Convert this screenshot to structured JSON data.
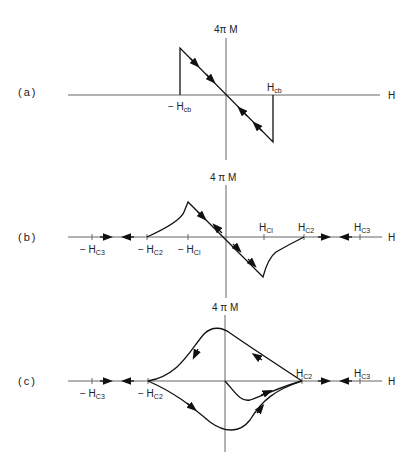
{
  "panels": [
    {
      "id": "a",
      "label": "(a)",
      "y_axis_label": "4π M",
      "x_axis_label": "H",
      "ticks": [
        {
          "text": "− H",
          "sub": "cb"
        },
        {
          "text": "H",
          "sub": "cb"
        }
      ]
    },
    {
      "id": "b",
      "label": "(b)",
      "y_axis_label": "4 π M",
      "x_axis_label": "H",
      "ticks": [
        {
          "text": "− H",
          "sub": "C3"
        },
        {
          "text": "− H",
          "sub": "C2"
        },
        {
          "text": "− H",
          "sub": "Cl"
        },
        {
          "text": "H",
          "sub": "Cl"
        },
        {
          "text": "H",
          "sub": "C2"
        },
        {
          "text": "H",
          "sub": "C3"
        }
      ]
    },
    {
      "id": "c",
      "label": "(c)",
      "y_axis_label": "4 π M",
      "x_axis_label": "H",
      "ticks": [
        {
          "text": "− H",
          "sub": "C3"
        },
        {
          "text": "− H",
          "sub": "C2"
        },
        {
          "text": "H",
          "sub": "C2"
        },
        {
          "text": "H",
          "sub": "C3"
        }
      ]
    }
  ]
}
